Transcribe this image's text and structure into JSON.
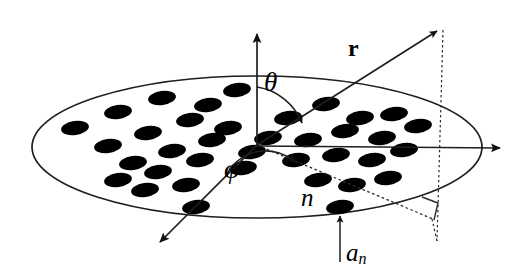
{
  "figure": {
    "type": "diagram",
    "background": "#ffffff",
    "stroke_color": "#1a1a1a",
    "element_fill": "#000000",
    "width": 532,
    "height": 280
  },
  "labels": {
    "theta": "θ",
    "phi": "φ",
    "r": "r",
    "n": "n",
    "a_base": "a",
    "a_sub": "n"
  },
  "annotations": {
    "theta_desc": "polar angle between vertical z-axis and vector r",
    "phi_desc": "azimuthal angle in aperture plane",
    "r_desc": "position vector to far-field observation point",
    "n_desc": "index of the n-th array element",
    "an_desc": "radius of the n-th element"
  },
  "geometry": {
    "origin": {
      "x": 257,
      "y": 145
    },
    "aperture_ellipse": {
      "cx": 257,
      "cy": 147,
      "rx": 225,
      "ry": 71
    },
    "axes": [
      {
        "name": "z-axis",
        "x1": 257,
        "y1": 145,
        "x2": 257,
        "y2": 25,
        "arrow": true
      },
      {
        "name": "x-axis-right",
        "x1": 257,
        "y1": 146,
        "x2": 512,
        "y2": 148,
        "arrow": true
      },
      {
        "name": "y-axis-front",
        "x1": 257,
        "y1": 145,
        "x2": 153,
        "y2": 249,
        "arrow": true
      },
      {
        "name": "r-vector",
        "x1": 257,
        "y1": 145,
        "x2": 443,
        "y2": 26,
        "arrow": true
      }
    ],
    "projection_lines": [
      {
        "name": "r-projection-in-plane",
        "x1": 257,
        "y1": 145,
        "x2": 432,
        "y2": 218,
        "dashed": true
      },
      {
        "name": "drop-line-vertical",
        "x1": 443,
        "y1": 28,
        "x2": 437,
        "y2": 240,
        "dashed": true
      },
      {
        "name": "foot-line",
        "x1": 432,
        "y1": 218,
        "x2": 437,
        "y2": 240,
        "dashed": true
      }
    ],
    "right_angle_marker": {
      "x": 424,
      "y": 200,
      "size": 16
    },
    "theta_arc": {
      "cx": 257,
      "cy": 145,
      "r": 58,
      "start_deg": -90,
      "end_deg": -33
    },
    "phi_arc": {
      "cx": 257,
      "cy": 145,
      "r": 44,
      "start_deg": 135,
      "end_deg": 23
    },
    "a_n_arrow": {
      "x1": 340,
      "y1": 258,
      "x2": 340,
      "y2": 218
    }
  },
  "label_positions": {
    "theta": {
      "x": 264,
      "y": 82
    },
    "phi": {
      "x": 227,
      "y": 168
    },
    "r": {
      "x": 350,
      "y": 48
    },
    "n": {
      "x": 303,
      "y": 195
    },
    "a_n": {
      "x": 345,
      "y": 252
    }
  },
  "elements": {
    "count": 35,
    "shape": "ellipse",
    "rx": 14,
    "ry": 7,
    "rotation_deg": -8,
    "positions": [
      {
        "x": 75,
        "y": 128
      },
      {
        "x": 118,
        "y": 112
      },
      {
        "x": 162,
        "y": 98
      },
      {
        "x": 208,
        "y": 105
      },
      {
        "x": 237,
        "y": 90
      },
      {
        "x": 108,
        "y": 146
      },
      {
        "x": 148,
        "y": 133
      },
      {
        "x": 190,
        "y": 120
      },
      {
        "x": 228,
        "y": 128
      },
      {
        "x": 268,
        "y": 138
      },
      {
        "x": 133,
        "y": 163
      },
      {
        "x": 172,
        "y": 151
      },
      {
        "x": 212,
        "y": 140
      },
      {
        "x": 252,
        "y": 152
      },
      {
        "x": 118,
        "y": 180
      },
      {
        "x": 158,
        "y": 172
      },
      {
        "x": 200,
        "y": 160
      },
      {
        "x": 243,
        "y": 168
      },
      {
        "x": 145,
        "y": 190
      },
      {
        "x": 186,
        "y": 185
      },
      {
        "x": 196,
        "y": 207
      },
      {
        "x": 288,
        "y": 118
      },
      {
        "x": 326,
        "y": 104
      },
      {
        "x": 360,
        "y": 118
      },
      {
        "x": 394,
        "y": 114
      },
      {
        "x": 308,
        "y": 140
      },
      {
        "x": 345,
        "y": 131
      },
      {
        "x": 382,
        "y": 138
      },
      {
        "x": 418,
        "y": 126
      },
      {
        "x": 296,
        "y": 160
      },
      {
        "x": 336,
        "y": 155
      },
      {
        "x": 372,
        "y": 160
      },
      {
        "x": 404,
        "y": 150
      },
      {
        "x": 318,
        "y": 180
      },
      {
        "x": 352,
        "y": 185
      },
      {
        "x": 388,
        "y": 178
      },
      {
        "x": 340,
        "y": 207
      }
    ]
  }
}
